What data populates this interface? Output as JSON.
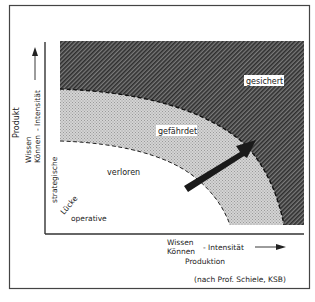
{
  "diagram": {
    "title": "",
    "zones": {
      "secured": "gesichert",
      "endangered": "gefährdet",
      "lost": "verloren"
    },
    "gap_labels": {
      "strategic": "strategische",
      "gap": "Lücke",
      "operative": "operative"
    },
    "y_axis": {
      "category": "Produkt",
      "line1": "Wissen",
      "line2": "Können",
      "suffix": "- Intensität"
    },
    "x_axis": {
      "category": "Produktion",
      "line1": "Wissen",
      "line2": "Können",
      "suffix": "- Intensität"
    },
    "source": "(nach Prof. Schiele, KSB)",
    "colors": {
      "frame": "#444444",
      "dark_hatch": "#4a4a4a",
      "light_dots": "#b8b8b8",
      "arrow": "#1a1a1a",
      "background": "#ffffff"
    }
  }
}
